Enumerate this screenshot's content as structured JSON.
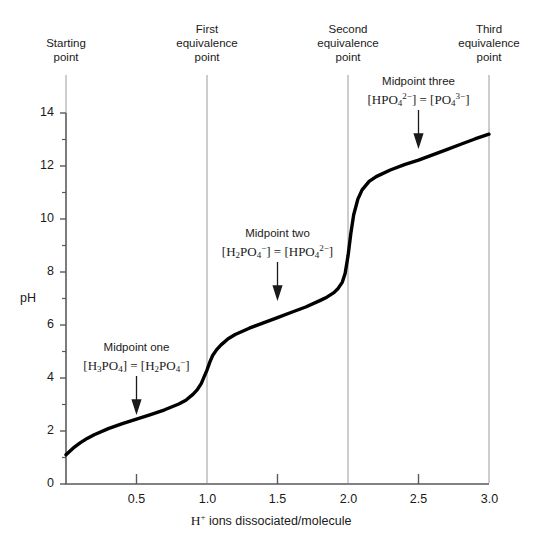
{
  "chart_data": {
    "type": "line",
    "title": "",
    "xlabel": "H+ ions dissociated/molecule",
    "ylabel": "pH",
    "xlim": [
      0,
      3.0
    ],
    "ylim": [
      0,
      14
    ],
    "grid": false,
    "legend": "none",
    "x_ticks": [
      0,
      0.5,
      1.0,
      1.5,
      2.0,
      2.5,
      3.0
    ],
    "x_tick_labels": [
      "",
      "0.5",
      "1.0",
      "1.5",
      "2.0",
      "2.5",
      "3.0"
    ],
    "y_ticks": [
      0,
      1,
      2,
      3,
      4,
      5,
      6,
      7,
      8,
      9,
      10,
      11,
      12,
      13,
      14
    ],
    "y_tick_labels": [
      "0",
      "",
      "2",
      "",
      "4",
      "",
      "6",
      "",
      "8",
      "",
      "10",
      "",
      "12",
      "",
      "14"
    ],
    "series": [
      {
        "name": "Titration curve of H3PO4",
        "x": [
          0.0,
          0.05,
          0.1,
          0.15,
          0.2,
          0.3,
          0.4,
          0.5,
          0.6,
          0.7,
          0.8,
          0.85,
          0.9,
          0.93,
          0.96,
          0.98,
          1.0,
          1.02,
          1.04,
          1.07,
          1.1,
          1.15,
          1.2,
          1.3,
          1.4,
          1.5,
          1.6,
          1.7,
          1.8,
          1.85,
          1.9,
          1.93,
          1.96,
          1.98,
          2.0,
          2.02,
          2.04,
          2.07,
          2.1,
          2.15,
          2.2,
          2.3,
          2.4,
          2.5,
          2.6,
          2.7,
          2.8,
          2.9,
          3.0
        ],
        "y": [
          1.1,
          1.35,
          1.55,
          1.72,
          1.86,
          2.09,
          2.28,
          2.45,
          2.62,
          2.8,
          3.02,
          3.16,
          3.38,
          3.55,
          3.8,
          4.05,
          4.3,
          4.6,
          4.85,
          5.08,
          5.25,
          5.48,
          5.64,
          5.88,
          6.08,
          6.28,
          6.48,
          6.68,
          6.92,
          7.05,
          7.22,
          7.38,
          7.62,
          7.95,
          8.6,
          9.45,
          10.15,
          10.75,
          11.1,
          11.42,
          11.6,
          11.85,
          12.05,
          12.22,
          12.42,
          12.62,
          12.82,
          13.02,
          13.2
        ]
      }
    ],
    "vertical_lines": [
      {
        "name": "starting-point",
        "x": 0.0
      },
      {
        "name": "first-equivalence-point",
        "x": 1.0
      },
      {
        "name": "second-equivalence-point",
        "x": 2.0
      },
      {
        "name": "third-equivalence-point",
        "x": 3.0
      }
    ],
    "annotations": [
      {
        "name": "midpoint-one",
        "x": 0.5,
        "arrow_to_y": 2.45,
        "label": "Midpoint one"
      },
      {
        "name": "midpoint-two",
        "x": 1.5,
        "arrow_to_y": 6.28,
        "label": "Midpoint two"
      },
      {
        "name": "midpoint-three",
        "x": 2.5,
        "arrow_to_y": 12.22,
        "label": "Midpoint three"
      }
    ]
  },
  "headers": {
    "starting_point": "Starting\npoint",
    "first_equivalence": "First\nequivalence\npoint",
    "second_equivalence": "Second\nequivalence\npoint",
    "third_equivalence": "Third\nequivalence\npoint"
  },
  "midpoints": {
    "one": {
      "title": "Midpoint one",
      "formula_plain": "[H3PO4] = [H2PO4-]"
    },
    "two": {
      "title": "Midpoint two",
      "formula_plain": "[H2PO4-] = [HPO4 2-]"
    },
    "three": {
      "title": "Midpoint three",
      "formula_plain": "[HPO4 2-] = [PO4 3-]"
    }
  },
  "axes": {
    "y_title": "pH",
    "x_title_plain": "H+ ions dissociated/molecule",
    "x_tick_labels": [
      "0.5",
      "1.0",
      "1.5",
      "2.0",
      "2.5",
      "3.0"
    ],
    "y_tick_labels": [
      "14",
      "12",
      "10",
      "8",
      "6",
      "4",
      "2",
      "0"
    ]
  },
  "colors": {
    "curve": "#000000",
    "axis": "#58595b",
    "vline": "#9a9a9a",
    "text": "#1a1a1a",
    "background": "#ffffff"
  }
}
